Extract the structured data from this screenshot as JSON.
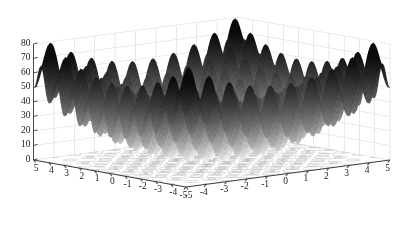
{
  "figure": {
    "title": "",
    "background_color": "#ffffff",
    "colormap": "bone-grayscale",
    "surface_dark": "#1a1a1a",
    "surface_light": "#ffffff",
    "axis_color": "#3a3a3a",
    "grid_color": "#d9d9d9",
    "contour_color": "#9a9a9a"
  },
  "axes": {
    "z": {
      "label": "",
      "min": 0,
      "max": 80,
      "ticks": [
        "0",
        "10",
        "20",
        "30",
        "40",
        "50",
        "60",
        "70",
        "80"
      ],
      "tick_values": [
        0,
        10,
        20,
        30,
        40,
        50,
        60,
        70,
        80
      ]
    },
    "x_left": {
      "label": "",
      "min": -5,
      "max": 5,
      "ticks": [
        "5",
        "4",
        "3",
        "2",
        "1",
        "0",
        "-1",
        "-2",
        "-3",
        "-4",
        "-5"
      ],
      "tick_values": [
        5,
        4,
        3,
        2,
        1,
        0,
        -1,
        -2,
        -3,
        -4,
        -5
      ]
    },
    "y_right": {
      "label": "",
      "min": -5,
      "max": 5,
      "ticks": [
        "-5",
        "-4",
        "-3",
        "-2",
        "-1",
        "0",
        "1",
        "2",
        "3",
        "4",
        "5"
      ],
      "tick_values": [
        -5,
        -4,
        -3,
        -2,
        -1,
        0,
        1,
        2,
        3,
        4,
        5
      ]
    }
  },
  "chart_data": {
    "type": "surface",
    "title": "",
    "xlabel": "",
    "ylabel": "",
    "zlabel": "",
    "xlim": [
      -5,
      5
    ],
    "ylim": [
      -5,
      5
    ],
    "zlim": [
      0,
      80
    ],
    "grid": true,
    "legend": "none",
    "colormap": "bone",
    "function": "rastrigin",
    "function_formula": "z = 20 + x^2 + y^2 - 10*(cos(2*pi*x) + cos(2*pi*y))",
    "base_contour": true,
    "view_azimuth": -37.5,
    "view_elevation": 30,
    "samples": 161,
    "x_tick_labels": [
      "5",
      "4",
      "3",
      "2",
      "1",
      "0",
      "-1",
      "-2",
      "-3",
      "-4",
      "-5"
    ],
    "y_tick_labels": [
      "-5",
      "-4",
      "-3",
      "-2",
      "-1",
      "0",
      "1",
      "2",
      "3",
      "4",
      "5"
    ],
    "z_tick_labels": [
      "0",
      "10",
      "20",
      "30",
      "40",
      "50",
      "60",
      "70",
      "80"
    ],
    "global_minimum": {
      "x": 0,
      "y": 0,
      "z": 0
    },
    "global_maximum_approx": 80.7
  }
}
